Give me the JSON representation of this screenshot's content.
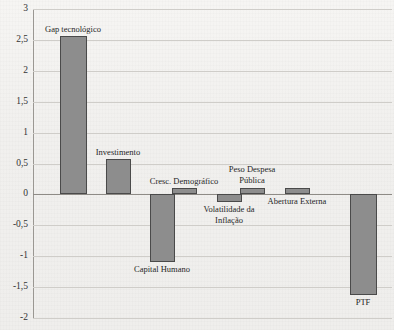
{
  "page": {
    "cropped_caption_top": "",
    "background_color": "#f2f1ef",
    "bar_fill_color": "#8d8d8d",
    "bar_border_color": "#4a4a4a",
    "gridline_color": "#cfcdc9"
  },
  "chart_data": {
    "type": "bar",
    "title": "",
    "xlabel": "",
    "ylabel": "",
    "ylim": [
      -2,
      3
    ],
    "ytick_labels": [
      "3",
      "2,5",
      "2",
      "1,5",
      "1",
      "0,5",
      "0",
      "-0,5",
      "-1",
      "-1,5",
      "-2"
    ],
    "ytick_values": [
      3,
      2.5,
      2,
      1.5,
      1,
      0.5,
      0,
      -0.5,
      -1,
      -1.5,
      -2
    ],
    "grid": true,
    "legend": "none",
    "orientation": "vertical",
    "decimal_separator": ",",
    "categories": [
      "Gap tecnológico",
      "Investimento",
      "Capital Humano",
      "Cresc. Demográfico",
      "Volatilidade da Inflação",
      "Peso Despesa Pública",
      "Abertura Externa",
      "PTF"
    ],
    "values": [
      2.57,
      0.57,
      -1.1,
      0.1,
      -0.12,
      0.1,
      0.1,
      -1.63
    ],
    "labels": [
      {
        "text": "Gap tecnológico",
        "position": "above"
      },
      {
        "text": "Investimento",
        "position": "above"
      },
      {
        "text": "Capital Humano",
        "position": "below"
      },
      {
        "text": "Cresc. Demográfico",
        "position": "above"
      },
      {
        "text": "Volatilidade da Inflação",
        "position": "below"
      },
      {
        "text": "Peso Despesa Pública",
        "position": "above"
      },
      {
        "text": "Abertura Externa",
        "position": "below"
      },
      {
        "text": "PTF",
        "position": "below"
      }
    ]
  }
}
